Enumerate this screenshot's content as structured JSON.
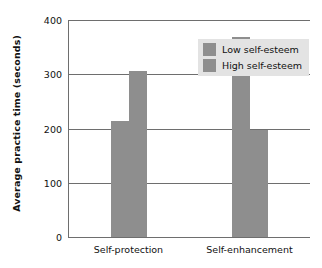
{
  "chart_data": {
    "type": "bar",
    "title": "",
    "xlabel": "",
    "ylabel": "Average practice time (seconds)",
    "categories": [
      "Self-protection",
      "Self-enhancement"
    ],
    "series": [
      {
        "name": "Low self-esteem",
        "values": [
          214,
          368
        ]
      },
      {
        "name": "High self-esteem",
        "values": [
          306,
          197
        ]
      }
    ],
    "ylim": [
      0,
      400
    ],
    "yticks": [
      0,
      100,
      200,
      300,
      400
    ],
    "ytick_labels": [
      "0",
      "100",
      "200",
      "300",
      "400"
    ],
    "grid": "horizontal",
    "legend_position": "top-right",
    "colors": {
      "bar_low": "#8e8e8e",
      "bar_high": "#8e8e8e",
      "grid": "#6e6e6e",
      "legend_background": "#e3e3e3",
      "text": "#111111",
      "background": "#ffffff"
    }
  }
}
